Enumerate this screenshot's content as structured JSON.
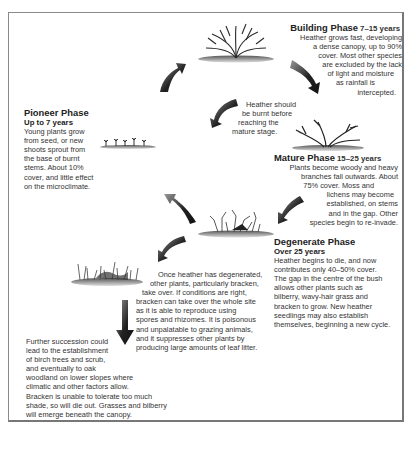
{
  "diagram": {
    "type": "cycle",
    "phases": [
      {
        "id": "pioneer",
        "title": "Pioneer Phase",
        "years": "Up to 7 years",
        "lines": [
          "Young plants grow",
          "from seed, or new",
          "shoots sprout from",
          "the base of burnt",
          "stems. About 10%",
          "cover, and little effect",
          "on the microclimate."
        ]
      },
      {
        "id": "building",
        "title": "Building Phase",
        "years": "7–15 years",
        "lines": [
          "Heather grows fast, developing",
          "a dense canopy, up to 90%",
          "cover. Most other species",
          "are excluded by the lack",
          "of light and moisture",
          "as rainfall is",
          "intercepted."
        ]
      },
      {
        "id": "mature",
        "title": "Mature Phase",
        "years": "15–25 years",
        "lines": [
          "Plants become woody and heavy",
          "branches fall outwards. About",
          "75% cover. Moss and",
          "lichens may become",
          "established, on stems",
          "and in the gap. Other",
          "species begin to re-invade."
        ]
      },
      {
        "id": "degenerate",
        "title": "Degenerate Phase",
        "years": "Over 25 years",
        "lines": [
          "Heather begins to die, and now",
          "contributes only 40–50% cover.",
          "The gap in the centre of the bush",
          "allows other plants such as",
          "bilberry, wavy-hair grass and",
          "bracken to grow. New heather",
          "seedlings may also establish",
          "themselves, beginning a new cycle."
        ]
      }
    ],
    "notes": {
      "burning": [
        "Heather should",
        "be burnt before",
        "reaching the",
        "mature stage."
      ],
      "bracken": [
        "Once heather has degenerated,",
        "other plants, particularly bracken,",
        "take over. If conditions are right,",
        "bracken can take over the whole site",
        "as it is able to reproduce using",
        "spores and rhizomes. It is poisonous",
        "and unpalatable to grazing animals,",
        "and it suppresses other plants by",
        "producing large amounts of leaf litter."
      ],
      "succession": [
        "Further succession could",
        "lead to the establishment",
        "of birch trees and scrub,",
        "and eventually to oak",
        "woodland on lower slopes where",
        "climatic and other factors allow.",
        "Bracken is unable to tolerate too much",
        "shade, so will die out. Grasses and bilberry",
        "will emerge beneath the canopy."
      ]
    },
    "illustrations": [
      "pioneer-seedlings",
      "building-dense-bush",
      "mature-spreading-bush",
      "degenerate-bush",
      "bracken-grass-patch"
    ],
    "arrows": [
      "pioneer-to-building",
      "building-to-mature",
      "mature-to-pioneer-burning",
      "mature-to-degenerate",
      "degenerate-to-pioneer",
      "degenerate-to-bracken",
      "bracken-to-woodland"
    ],
    "colors": {
      "text": "#333333",
      "frame": "#8a8a8a",
      "arrow_dark": "#1a1a1a",
      "arrow_light": "#9a9a9a"
    }
  }
}
